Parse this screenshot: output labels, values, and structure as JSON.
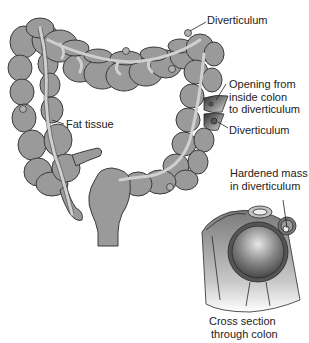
{
  "diagram": {
    "colors": {
      "colon_fill": "#9a9a9a",
      "colon_outline": "#3a3a3a",
      "fat_tissue": "#cfcfcf",
      "cross_section_dark": "#4a4a4a",
      "cross_section_light": "#e6e6e6",
      "label_text": "#222222"
    },
    "labels": {
      "diverticulum_top": "Diverticulum",
      "opening_line1": "Opening from",
      "opening_line2": "inside colon",
      "opening_line3": "to diverticulum",
      "diverticulum_side": "Diverticulum",
      "fat_tissue": "Fat tissue",
      "hardened_line1": "Hardened mass",
      "hardened_line2": "in diverticulum",
      "cross_line1": "Cross section",
      "cross_line2": "through colon"
    }
  }
}
